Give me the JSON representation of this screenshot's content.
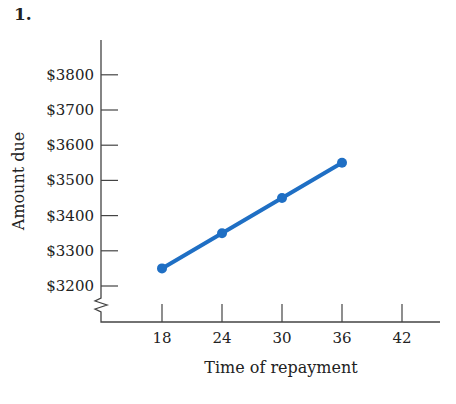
{
  "problem_number": "1.",
  "chart_data": {
    "type": "line",
    "title": "",
    "xlabel": "Time of repayment",
    "ylabel": "Amount due",
    "x_ticks": [
      "18",
      "24",
      "30",
      "36",
      "42"
    ],
    "y_ticks": [
      "$3200",
      "$3300",
      "$3400",
      "$3500",
      "$3600",
      "$3700",
      "$3800"
    ],
    "x": [
      18,
      24,
      30,
      36
    ],
    "series": [
      {
        "name": "Amount due",
        "values": [
          3250,
          3350,
          3450,
          3550
        ]
      }
    ],
    "xlim": [
      12,
      45
    ],
    "ylim": [
      3100,
      3900
    ],
    "y_axis_break": true,
    "grid": false,
    "legend": "none",
    "line_color": "#1f6fc4"
  }
}
